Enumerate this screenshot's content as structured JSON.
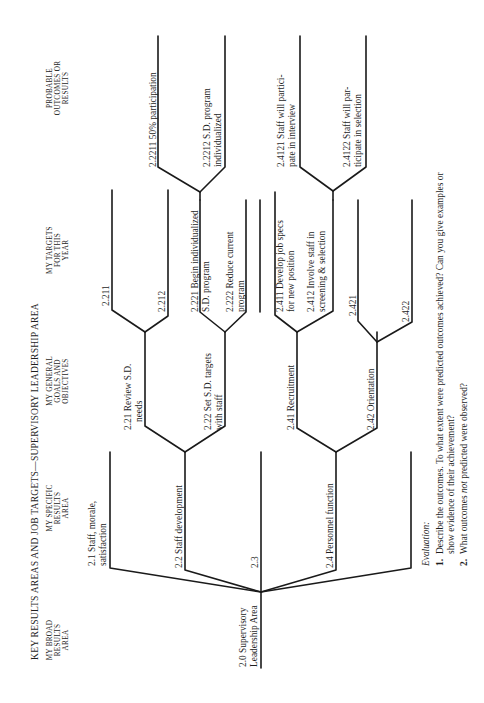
{
  "title": "KEY RESULTS AREAS AND JOB TARGETS—SUPERVISORY LEADERSHIP AREA",
  "column_headers": {
    "broad": [
      "MY BROAD",
      "RESULTS",
      "AREA"
    ],
    "specific": [
      "MY SPECIFIC",
      "RESULTS",
      "AREA"
    ],
    "goals": [
      "MY GENERAL",
      "GOALS AND",
      "OBJECTIVES"
    ],
    "targets": [
      "MY TARGETS",
      "FOR THIS",
      "YEAR"
    ],
    "outcomes": [
      "PROBABLE",
      "OUTCOMES OR",
      "RESULTS"
    ]
  },
  "nodes": {
    "n2_0": [
      "2.0  Supervisory",
      "Leadership Area"
    ],
    "n2_1": [
      "2.1  Staff, morale,",
      "satisfaction"
    ],
    "n2_2": [
      "2.2  Staff development"
    ],
    "n2_3": [
      "2.3"
    ],
    "n2_4": [
      "2.4  Personnel function"
    ],
    "n2_21": [
      "2.21  Review S.D.",
      "needs"
    ],
    "n2_22": [
      "2.22  Set S.D. targets",
      "with staff"
    ],
    "n2_41": [
      "2.41  Recruitment"
    ],
    "n2_42": [
      "2.42  Orientation"
    ],
    "n2_211": [
      "2.211"
    ],
    "n2_212": [
      "2.212"
    ],
    "n2_221": [
      "2.221  Begin individualized",
      "S.D. program"
    ],
    "n2_222": [
      "2.222  Reduce current",
      "program"
    ],
    "n2_411": [
      "2.411  Develop job specs",
      "for new position"
    ],
    "n2_412": [
      "2.412  Involve staff in",
      "screening & selection"
    ],
    "n2_421": [
      "2.421"
    ],
    "n2_422": [
      "2.422"
    ],
    "n2_2211": [
      "2.2211  50% participation"
    ],
    "n2_2212": [
      "2.2212  S.D. program",
      "individualized"
    ],
    "n2_4121": [
      "2.4121  Staff will partici-",
      "pate in interview"
    ],
    "n2_4122": [
      "2.4122  Staff will par-",
      "ticipate in selection"
    ]
  },
  "evaluation": {
    "heading": "Evaluation:",
    "q1_num": "1.",
    "q1_line1": "Describe the outcomes. To what extent were predicted outcomes achieved? Can you give examples or",
    "q1_line2": "show evidence of their achievement?",
    "q2_num": "2.",
    "q2_pre": "What outcomes ",
    "q2_em": "not",
    "q2_post": " predicted were observed?"
  }
}
